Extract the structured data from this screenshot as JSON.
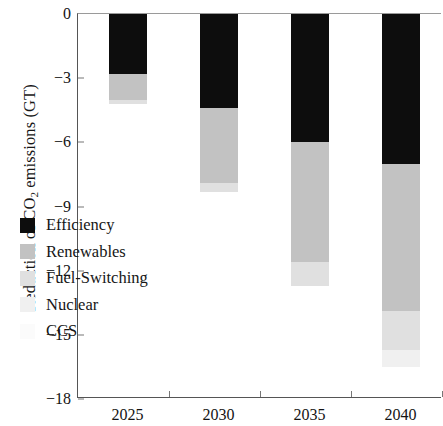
{
  "chart_data": {
    "type": "bar",
    "subtype": "stacked",
    "title": "",
    "xlabel": "",
    "ylabel": "Reduction of CO2 emissions (GT)",
    "ylabel_parts": {
      "pre": "Reduction of CO",
      "sub": "2",
      "post": " emissions (GT)"
    },
    "categories": [
      "2025",
      "2030",
      "2035",
      "2040"
    ],
    "ylim": [
      -18,
      0
    ],
    "yticks": [
      0,
      -3,
      -6,
      -9,
      -12,
      -15,
      -18
    ],
    "ytick_labels": [
      "0",
      "−3",
      "−6",
      "−9",
      "−12",
      "−15",
      "−18"
    ],
    "grid": false,
    "legend_position": "inside-left",
    "series": [
      {
        "name": "Efficiency",
        "color": "#0d0d0d",
        "values": [
          -2.8,
          -4.4,
          -6.0,
          -7.0
        ]
      },
      {
        "name": "Renewables",
        "color": "#c2c2c2",
        "values": [
          -1.2,
          -3.5,
          -5.6,
          -6.9
        ]
      },
      {
        "name": "Fuel-Switching",
        "color": "#e0e0e0",
        "values": [
          -0.2,
          -0.4,
          -1.1,
          -1.8
        ]
      },
      {
        "name": "Nuclear",
        "color": "#f0f0f0",
        "values": [
          0.0,
          0.0,
          0.0,
          -0.8
        ]
      },
      {
        "name": "CCS",
        "color": "#fbfbfb",
        "values": [
          0.0,
          0.0,
          0.0,
          0.0
        ]
      }
    ],
    "totals": [
      -4.2,
      -8.3,
      -12.7,
      -16.5
    ]
  },
  "legend": {
    "items": [
      {
        "label": "Efficiency"
      },
      {
        "label": "Renewables"
      },
      {
        "label": "Fuel-Switching"
      },
      {
        "label": "Nuclear"
      },
      {
        "label": "CCS"
      }
    ]
  }
}
